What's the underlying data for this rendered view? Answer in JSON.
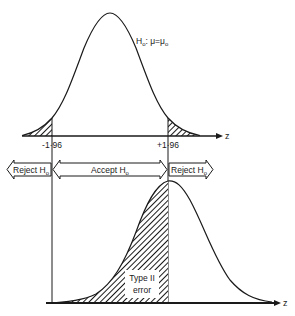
{
  "diagram": {
    "null_curve": {
      "label_main": "H",
      "label_sub": "o",
      "label_eq": ": μ=μ",
      "label_eq_sub": "o"
    },
    "axis_label": "z",
    "critical_values": {
      "left": "-1·96",
      "right": "+1·96"
    },
    "regions": {
      "reject_left": {
        "text": "Reject H",
        "sub": "o"
      },
      "accept": {
        "text": "Accept H",
        "sub": "o"
      },
      "reject_right": {
        "text": "Reject H",
        "sub": "o"
      }
    },
    "type2": {
      "line1": "Type II",
      "line2": "error"
    },
    "colors": {
      "ink": "#1a1a1a",
      "background": "#ffffff"
    }
  }
}
